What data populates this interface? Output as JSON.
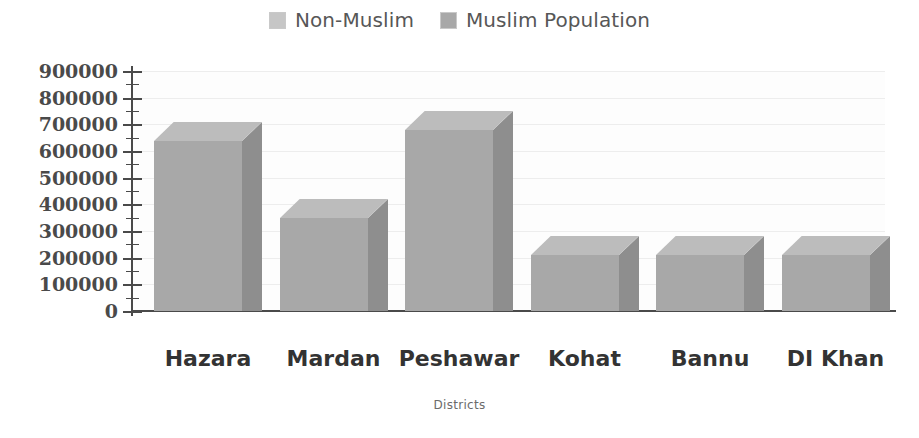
{
  "chart_data": {
    "type": "bar",
    "title": "",
    "subtitle": "",
    "xlabel": "Districts",
    "ylabel": "",
    "categories": [
      "Hazara",
      "Mardan",
      "Peshawar",
      "Kohat",
      "Bannu",
      "DI Khan"
    ],
    "series": [
      {
        "name": "Muslim Population",
        "values": [
          710000,
          420000,
          750000,
          280000,
          280000,
          280000
        ]
      }
    ],
    "legend": [
      {
        "label": "Non-Muslim",
        "color": "#c6c6c6"
      },
      {
        "label": "Muslim Population",
        "color": "#a8a8a8"
      }
    ],
    "legend_position": "top-center",
    "ylim": [
      0,
      900000
    ],
    "ytick_labels": [
      "900000",
      "800000",
      "700000",
      "600000",
      "500000",
      "400000",
      "300000",
      "200000",
      "100000",
      "0"
    ],
    "ytick_values": [
      900000,
      800000,
      700000,
      600000,
      500000,
      400000,
      300000,
      200000,
      100000,
      0
    ],
    "ytick_step": 100000,
    "yminor_step": 50000,
    "grid": true,
    "style": "3d-column",
    "colors": {
      "bar_front": "#a8a8a8",
      "bar_top": "#bcbcbc",
      "bar_side": "#8e8e8e",
      "axis": "#4a4a4a",
      "gridline": "#ededed",
      "plot_background": "#fdfdfd",
      "label_text": "#333333",
      "axis_title_text": "#6b6b6b",
      "legend_text": "#575757"
    }
  }
}
